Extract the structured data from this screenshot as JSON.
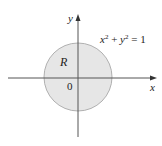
{
  "figure": {
    "equation": {
      "x": "x",
      "exp1": "2",
      "plus": " + ",
      "y": "y",
      "exp2": "2",
      "rhs": " = 1"
    },
    "region_label": "R",
    "origin_label": "0",
    "x_axis_label": "x",
    "y_axis_label": "y"
  },
  "colors": {
    "region_fill": "#e6e6e6",
    "circle_stroke": "#b0b0b0",
    "axis": "#555555"
  }
}
